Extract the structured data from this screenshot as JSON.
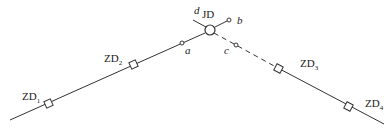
{
  "diagram": {
    "labels": {
      "jd": "JD",
      "d": "d",
      "b": "b",
      "a": "a",
      "c": "c",
      "zd1": {
        "main": "ZD",
        "sub": "1"
      },
      "zd2": {
        "main": "ZD",
        "sub": "2"
      },
      "zd3": {
        "main": "ZD",
        "sub": "3"
      },
      "zd4": {
        "main": "ZD",
        "sub": "4"
      }
    },
    "colors": {
      "line": "#333333",
      "background": "#ffffff"
    }
  }
}
